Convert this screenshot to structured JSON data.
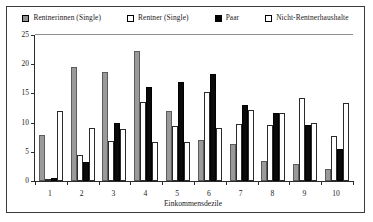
{
  "chart_data": {
    "type": "bar",
    "title": "",
    "xlabel": "Einkommensdezile",
    "ylabel": "",
    "ylim": [
      0,
      25
    ],
    "yticks": [
      0,
      5,
      10,
      15,
      20,
      25
    ],
    "grid": false,
    "legend_position": "top",
    "categories": [
      "1",
      "2",
      "3",
      "4",
      "5",
      "6",
      "7",
      "8",
      "9",
      "10"
    ],
    "series": [
      {
        "name": "Rentnerinnen (Single)",
        "swatch": "gray",
        "color": "#9a9a9a",
        "values": [
          7.8,
          19.6,
          18.7,
          22.3,
          12.0,
          7.1,
          6.4,
          3.4,
          2.9,
          2.1
        ]
      },
      {
        "name": "Rentner (Single)",
        "swatch": "white",
        "color": "#ffffff",
        "values": [
          0.4,
          4.4,
          6.9,
          13.5,
          9.5,
          15.3,
          9.8,
          9.6,
          14.3,
          7.7
        ]
      },
      {
        "name": "Paar",
        "swatch": "black",
        "color": "#000000",
        "values": [
          0.5,
          3.3,
          10.0,
          16.1,
          17.0,
          18.4,
          13.1,
          11.6,
          9.6,
          5.4
        ]
      },
      {
        "name": "Nicht-Rentnerhaushalte",
        "swatch": "open",
        "color": "#ffffff",
        "values": [
          12.0,
          9.1,
          8.9,
          6.7,
          6.7,
          9.0,
          12.2,
          11.7,
          10.0,
          13.4
        ]
      }
    ]
  }
}
